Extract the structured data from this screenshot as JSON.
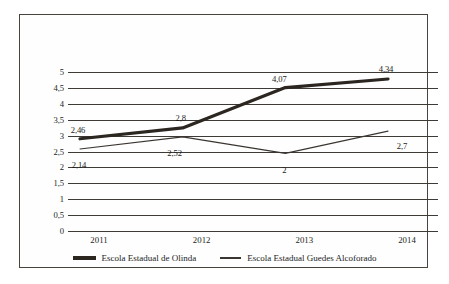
{
  "chart_data": {
    "type": "line",
    "title": "",
    "xlabel": "",
    "ylabel": "",
    "categories": [
      "2011",
      "2012",
      "2013",
      "2014"
    ],
    "ylim": [
      0,
      5
    ],
    "ytick_step": 0.5,
    "ytick_labels": [
      "5",
      "4,5",
      "4",
      "3,5",
      "3",
      "2,5",
      "2",
      "1,5",
      "1",
      "0,5",
      "0"
    ],
    "ytick_values": [
      5,
      4.5,
      4,
      3.5,
      3,
      2.5,
      2,
      1.5,
      1,
      0.5,
      0
    ],
    "grid": true,
    "legend_position": "bottom",
    "decimal_separator": ",",
    "series": [
      {
        "name": "Escola Estadual de Olinda",
        "values": [
          2.46,
          2.8,
          4.07,
          4.34
        ],
        "labels": [
          "2,46",
          "2,8",
          "4,07",
          "4,34"
        ],
        "color": "#2b2620",
        "line_width": "thick"
      },
      {
        "name": "Escola Estadual Guedes Alcoforado",
        "values": [
          2.14,
          2.52,
          2,
          2.7
        ],
        "labels": [
          "2,14",
          "2,52",
          "2",
          "2,7"
        ],
        "color": "#3a3530",
        "line_width": "thin"
      }
    ]
  },
  "legend": {
    "items": [
      {
        "label": "Escola Estadual de Olinda",
        "marker": "thick-line-swatch"
      },
      {
        "label": "Escola Estadual Guedes Alcoforado",
        "marker": "thin-line-swatch"
      }
    ]
  },
  "colors": {
    "frame_border": "#4a433c",
    "gridline": "#3e3a35",
    "series_olinda": "#2b2620",
    "series_guedes": "#3a3530",
    "background": "#fefefe",
    "text": "#201d1a"
  }
}
